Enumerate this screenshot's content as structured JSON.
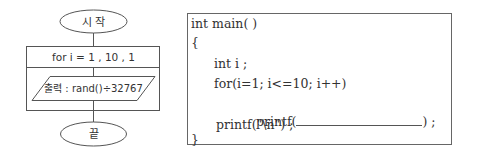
{
  "flowchart": {
    "start_label": "시 작",
    "loop_label": "for i = 1 , 10 , 1",
    "output_label": "출력 : rand()÷32767",
    "end_label": "끝"
  },
  "code": {
    "lines": [
      "int main( )",
      "{",
      "int i ;",
      "for(i=1; i<=10; i++)",
      "printf(",
      ") ;",
      "printf(\"\\n\") ;",
      "}"
    ]
  },
  "colors": {
    "stroke": "#555555",
    "text": "#333333"
  }
}
